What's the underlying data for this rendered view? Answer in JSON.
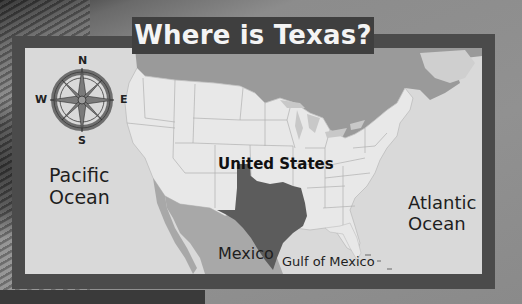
{
  "title": "Where is Texas?",
  "compass": {
    "north": "N",
    "south": "S",
    "east": "E",
    "west": "W"
  },
  "labels": {
    "canada": "Canada",
    "united_states": "United States",
    "pacific_line1": "Pacific",
    "pacific_line2": "Ocean",
    "atlantic_line1": "Atlantic",
    "atlantic_line2": "Ocean",
    "mexico": "Mexico",
    "gulf": "Gulf of Mexico"
  },
  "colors": {
    "frame": "#4b4b4b",
    "title_tab": "#3f3f3f",
    "ocean": "#d9d9d9",
    "canada": "#9a9a9a",
    "united_states": "#e8e8e8",
    "texas": "#5c5c5c",
    "mexico": "#a8a8a8"
  },
  "highlighted_region": "Texas"
}
